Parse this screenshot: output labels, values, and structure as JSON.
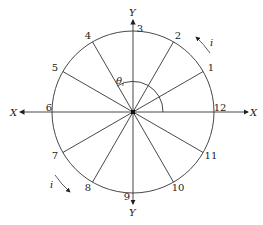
{
  "diagram": {
    "center": [
      133,
      112
    ],
    "radius": 81,
    "axes": {
      "x_left_label": "X",
      "x_right_label": "X",
      "y_top_label": "Y",
      "y_bottom_label": "Y"
    },
    "angle_label": "θ",
    "angle_subscript": "i",
    "rotation_label_top": "i",
    "rotation_label_bottom": "i",
    "points": [
      {
        "n": "1",
        "angle": 30
      },
      {
        "n": "2",
        "angle": 60
      },
      {
        "n": "3",
        "angle": 90
      },
      {
        "n": "4",
        "angle": 120
      },
      {
        "n": "5",
        "angle": 150
      },
      {
        "n": "6",
        "angle": 180
      },
      {
        "n": "7",
        "angle": 210
      },
      {
        "n": "8",
        "angle": 240
      },
      {
        "n": "9",
        "angle": 270
      },
      {
        "n": "10",
        "angle": 300
      },
      {
        "n": "11",
        "angle": 330
      },
      {
        "n": "12",
        "angle": 0
      }
    ]
  }
}
